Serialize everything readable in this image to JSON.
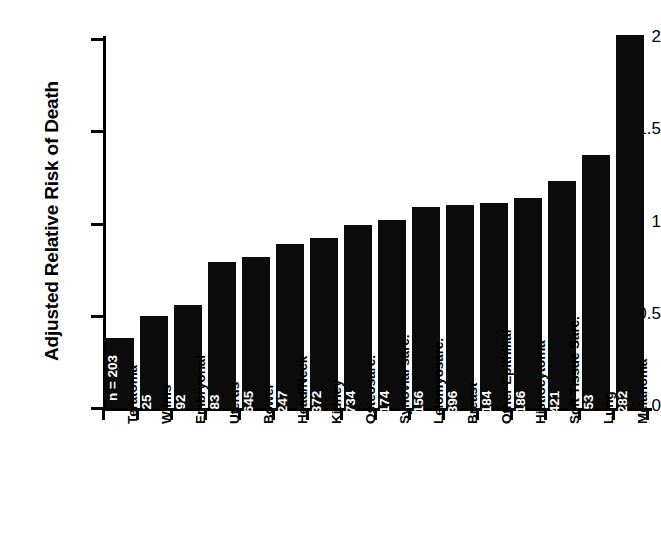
{
  "chart_data": {
    "type": "bar",
    "title": "",
    "xlabel": "",
    "ylabel": "Adjusted Relative Risk of Death",
    "ylim": [
      0,
      2
    ],
    "yticks": [
      "0",
      "0.5",
      "1",
      "1.5",
      "2"
    ],
    "ytick_values": [
      0,
      0.5,
      1,
      1.5,
      2
    ],
    "grid": false,
    "legend": "none",
    "bar_color": "#0b0b0b",
    "categories": [
      "Teratoma",
      "Wilms",
      "Embryonal",
      "Uterus",
      "Bowel",
      "Head/Neck",
      "Kidney",
      "Osteosarc.",
      "Synovial sarc.",
      "Leiomyosarc.",
      "Breast",
      "Other Epithilial",
      "Histiocytoma",
      "Soft Tissue Sarc.",
      "Lung",
      "Melanoma"
    ],
    "values": [
      0.38,
      0.5,
      0.56,
      0.79,
      0.82,
      0.89,
      0.92,
      0.99,
      1.02,
      1.09,
      1.1,
      1.11,
      1.14,
      1.23,
      1.37,
      2.02
    ],
    "n_labels": [
      "n = 203",
      "25",
      "92",
      "83",
      "645",
      "247",
      "372",
      "734",
      "174",
      "156",
      "396",
      "184",
      "186",
      "421",
      "53",
      "282"
    ],
    "n_values": [
      203,
      25,
      92,
      83,
      645,
      247,
      372,
      734,
      174,
      156,
      396,
      184,
      186,
      421,
      53,
      282
    ]
  }
}
